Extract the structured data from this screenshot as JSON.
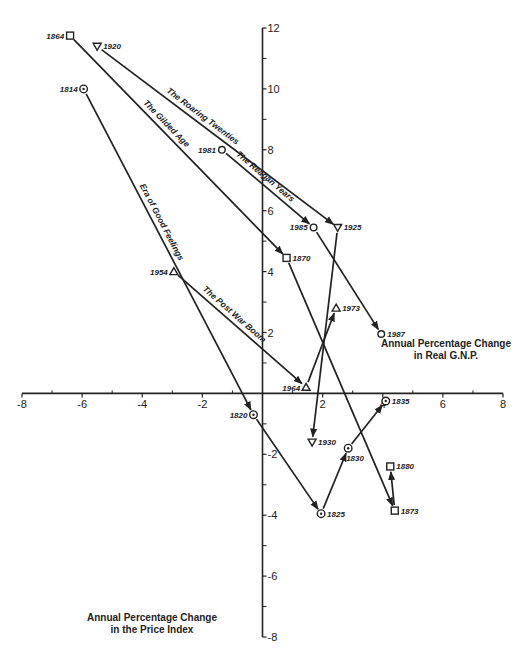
{
  "chart_data": {
    "type": "scatter",
    "title": "",
    "xlabel": "Annual Percentage Change in Real G.N.P.",
    "ylabel": "Annual Percentage Change in the Price Index",
    "xlabel_lines": [
      "Annual Percentage Change",
      "in Real G.N.P."
    ],
    "ylabel_lines": [
      "Annual Percentage Change",
      "in the Price Index"
    ],
    "xlim": [
      -8,
      8
    ],
    "ylim": [
      -8,
      12
    ],
    "x_ticks": [
      -8,
      -6,
      -4,
      -2,
      2,
      4,
      6,
      8
    ],
    "x_minor_ticks": [
      -7,
      -5,
      -3,
      -1,
      1,
      3,
      5,
      7
    ],
    "y_ticks": [
      -8,
      -6,
      -4,
      -2,
      2,
      4,
      6,
      8,
      10,
      12
    ],
    "y_minor_ticks": [
      -7,
      -5,
      -3,
      -1,
      1,
      3,
      5,
      7,
      9,
      11
    ],
    "x_tick_labels": [
      "-8",
      "-6",
      "-4",
      "-2",
      "2",
      "4",
      "6",
      "8"
    ],
    "y_tick_labels": [
      "-8",
      "-6",
      "-4",
      "-2",
      "2",
      "4",
      "6",
      "8",
      "10",
      "12"
    ],
    "grid": false,
    "points": [
      {
        "year": "1814",
        "x": -5.95,
        "y": 10.0,
        "marker": "circle-dot"
      },
      {
        "year": "1820",
        "x": -0.3,
        "y": -0.7,
        "marker": "circle-dot"
      },
      {
        "year": "1825",
        "x": 1.95,
        "y": -3.95,
        "marker": "circle-dot"
      },
      {
        "year": "1830",
        "x": 2.85,
        "y": -1.8,
        "marker": "circle-dot"
      },
      {
        "year": "1835",
        "x": 4.1,
        "y": -0.25,
        "marker": "circle-dot"
      },
      {
        "year": "1864",
        "x": -6.4,
        "y": 11.75,
        "marker": "square"
      },
      {
        "year": "1870",
        "x": 0.8,
        "y": 4.45,
        "marker": "square"
      },
      {
        "year": "1873",
        "x": 4.4,
        "y": -3.85,
        "marker": "square"
      },
      {
        "year": "1880",
        "x": 4.25,
        "y": -2.4,
        "marker": "square"
      },
      {
        "year": "1920",
        "x": -5.5,
        "y": 11.4,
        "marker": "triangle-down"
      },
      {
        "year": "1925",
        "x": 2.5,
        "y": 5.45,
        "marker": "triangle-down"
      },
      {
        "year": "1930",
        "x": 1.65,
        "y": -1.6,
        "marker": "triangle-down"
      },
      {
        "year": "1954",
        "x": -2.95,
        "y": 4.0,
        "marker": "triangle-up"
      },
      {
        "year": "1964",
        "x": 1.45,
        "y": 0.2,
        "marker": "triangle-up"
      },
      {
        "year": "1973",
        "x": 2.45,
        "y": 2.8,
        "marker": "triangle-up"
      },
      {
        "year": "1981",
        "x": -1.35,
        "y": 8.0,
        "marker": "circle"
      },
      {
        "year": "1985",
        "x": 1.7,
        "y": 5.45,
        "marker": "circle"
      },
      {
        "year": "1987",
        "x": 3.95,
        "y": 1.95,
        "marker": "circle"
      }
    ],
    "series": [
      {
        "name": "Era of Good Feelings",
        "years": [
          "1814",
          "1820",
          "1825",
          "1830",
          "1835"
        ],
        "label_segment": 0
      },
      {
        "name": "The Gilded Age",
        "years": [
          "1864",
          "1870",
          "1873",
          "1880"
        ],
        "label_segment": 0
      },
      {
        "name": "The Roaring Twenties",
        "years": [
          "1920",
          "1925",
          "1930"
        ],
        "label_segment": 0
      },
      {
        "name": "The Post War Boom",
        "years": [
          "1954",
          "1964",
          "1973"
        ],
        "label_segment": 0
      },
      {
        "name": "The Reagan Years",
        "years": [
          "1981",
          "1985",
          "1987"
        ],
        "label_segment": 0
      }
    ]
  }
}
